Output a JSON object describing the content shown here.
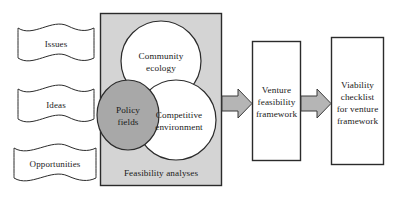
{
  "diagram": {
    "colors": {
      "panel_fill": "#d4d4d4",
      "panel_stroke": "#2b2b2b",
      "circle_fill": "#ffffff",
      "circle_stroke": "#2b2b2b",
      "highlight_circle_fill": "#a8a8a8",
      "arrow_fill": "#b5b5b5",
      "arrow_stroke": "#3a3a3a",
      "box_fill": "#ffffff",
      "box_stroke": "#2b2b2b",
      "text": "#1a1a1a",
      "page_background": "#ffffff"
    },
    "inputs": [
      {
        "id": "issues",
        "label": "Issues"
      },
      {
        "id": "ideas",
        "label": "Ideas"
      },
      {
        "id": "opportunities",
        "label": "Opportunities"
      }
    ],
    "panel": {
      "id": "feasibility-analyses",
      "caption": "Feasibility analyses",
      "circles": [
        {
          "id": "community-ecology",
          "line1": "Community",
          "line2": "ecology",
          "filled": false
        },
        {
          "id": "policy-fields",
          "line1": "Policy",
          "line2": "fields",
          "filled": true
        },
        {
          "id": "competitive-environment",
          "line1": "Competitive",
          "line2": "environment",
          "filled": false
        }
      ]
    },
    "arrows": [
      {
        "id": "arrow-panel-to-venture",
        "direction": "right"
      },
      {
        "id": "arrow-venture-to-viability",
        "direction": "right"
      }
    ],
    "stages": [
      {
        "id": "venture-feasibility-framework",
        "lines": [
          "Venture",
          "feasibility",
          "framework"
        ]
      },
      {
        "id": "viability-checklist",
        "lines": [
          "Viability",
          "checklist",
          "for venture",
          "framework"
        ]
      }
    ]
  }
}
